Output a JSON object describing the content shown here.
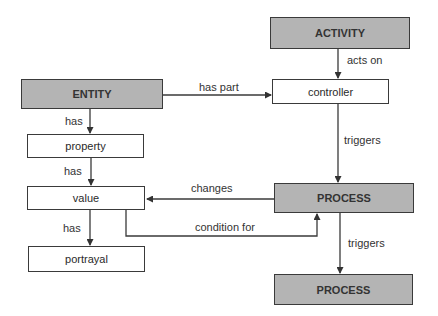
{
  "nodes": {
    "activity": "ACTIVITY",
    "entity": "ENTITY",
    "controller": "controller",
    "property": "property",
    "value": "value",
    "portrayal": "portrayal",
    "process1": "PROCESS",
    "process2": "PROCESS"
  },
  "edges": {
    "acts_on": "acts on",
    "has_part": "has part",
    "has_property": "has",
    "has_value": "has",
    "has_portrayal": "has",
    "triggers1": "triggers",
    "triggers2": "triggers",
    "changes": "changes",
    "condition_for": "condition for"
  },
  "colors": {
    "shaded_fill": "#b4b4b4",
    "stroke": "#3a3a3a"
  }
}
